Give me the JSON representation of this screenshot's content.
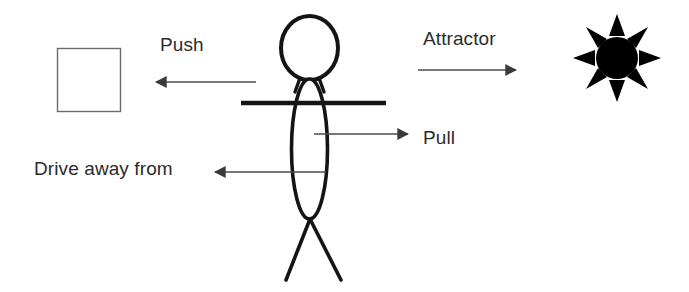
{
  "diagram": {
    "background_color": "#ffffff",
    "stroke_color": "#1a1a1a",
    "thin_stroke_color": "#555555",
    "text_color": "#2b2b2b",
    "square_stroke_color": "#6b6b6b",
    "sun_color": "#000000"
  },
  "labels": {
    "push": "Push",
    "attractor": "Attractor",
    "pull": "Pull",
    "drive_away_from": "Drive away from"
  },
  "objects": {
    "square": {
      "name": "square-object",
      "x": 57,
      "y": 48,
      "width": 63,
      "height": 63
    },
    "figure": {
      "name": "stick-figure"
    },
    "sun": {
      "name": "sun-attractor",
      "cx": 617,
      "cy": 58,
      "core_radius": 20,
      "rays": 8
    }
  },
  "arrows": [
    {
      "name": "push-arrow",
      "direction": "left",
      "from_x": 256,
      "to_x": 152,
      "y": 82,
      "label": "Push"
    },
    {
      "name": "attractor-arrow",
      "direction": "right",
      "from_x": 418,
      "to_x": 520,
      "y": 70,
      "label": "Attractor"
    },
    {
      "name": "pull-arrow",
      "direction": "right",
      "from_x": 314,
      "to_x": 412,
      "y": 134,
      "label": "Pull"
    },
    {
      "name": "drive-away-arrow",
      "direction": "left",
      "from_x": 326,
      "to_x": 211,
      "y": 172,
      "label": "Drive away from"
    }
  ]
}
